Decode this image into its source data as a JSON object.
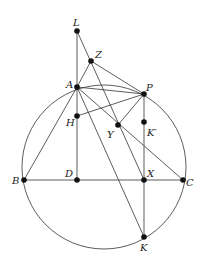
{
  "diagram": {
    "title": "",
    "circle": {
      "cx": 104,
      "cy": 167,
      "r": 82
    },
    "points": {
      "L": {
        "x": 77,
        "y": 31,
        "label": "L",
        "lx": 73,
        "ly": 26
      },
      "Z": {
        "x": 91,
        "y": 61,
        "label": "Z",
        "lx": 95,
        "ly": 58
      },
      "A": {
        "x": 77,
        "y": 87,
        "label": "A",
        "lx": 66,
        "ly": 88
      },
      "P": {
        "x": 144,
        "y": 94,
        "label": "P",
        "lx": 146,
        "ly": 91
      },
      "H": {
        "x": 77,
        "y": 116,
        "label": "H",
        "lx": 66,
        "ly": 126
      },
      "Y": {
        "x": 118,
        "y": 125,
        "label": "Y",
        "lx": 107,
        "ly": 138
      },
      "Kp": {
        "x": 144,
        "y": 122,
        "label": "K′",
        "lx": 147,
        "ly": 136
      },
      "B": {
        "x": 24,
        "y": 180,
        "label": "B",
        "lx": 12,
        "ly": 184
      },
      "D": {
        "x": 77,
        "y": 180,
        "label": "D",
        "lx": 65,
        "ly": 177
      },
      "X": {
        "x": 144,
        "y": 180,
        "label": "X",
        "lx": 147,
        "ly": 177
      },
      "C": {
        "x": 183,
        "y": 180,
        "label": "C",
        "lx": 186,
        "ly": 186
      },
      "K": {
        "x": 144,
        "y": 237,
        "label": "K",
        "lx": 140,
        "ly": 251
      }
    },
    "segments": [
      [
        "L",
        "D"
      ],
      [
        "L",
        "X"
      ],
      [
        "Z",
        "P"
      ],
      [
        "Z",
        "A"
      ],
      [
        "A",
        "P"
      ],
      [
        "A",
        "C"
      ],
      [
        "A",
        "K"
      ],
      [
        "H",
        "P"
      ],
      [
        "P",
        "Y"
      ],
      [
        "P",
        "K"
      ],
      [
        "B",
        "A"
      ],
      [
        "B",
        "C"
      ]
    ],
    "colors": {
      "stroke": "#333333",
      "point": "#111111",
      "label": "#222222"
    }
  }
}
